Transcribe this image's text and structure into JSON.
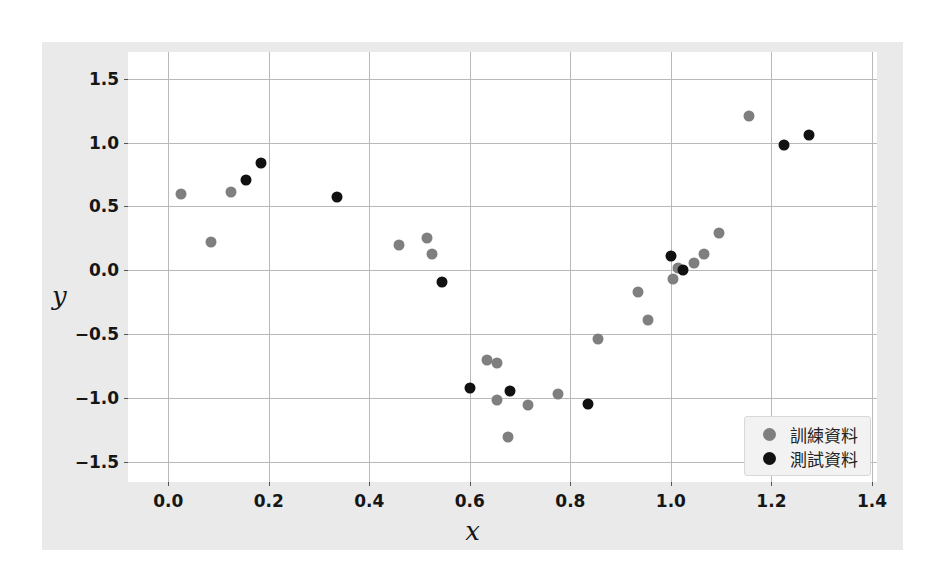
{
  "figure": {
    "background_color": "#eaeaea",
    "plot_background_color": "#ffffff",
    "grid_color": "#b9b9b9"
  },
  "chart_data": {
    "type": "scatter",
    "title": "",
    "xlabel": "x",
    "ylabel": "y",
    "xlim": [
      -0.08,
      1.41
    ],
    "ylim": [
      -1.66,
      1.71
    ],
    "xticks": [
      0.0,
      0.2,
      0.4,
      0.6,
      0.8,
      1.0,
      1.2,
      1.4
    ],
    "xticklabels": [
      "0.0",
      "0.2",
      "0.4",
      "0.6",
      "0.8",
      "1.0",
      "1.2",
      "1.4"
    ],
    "yticks": [
      1.5,
      1.0,
      0.5,
      0.0,
      -0.5,
      -1.0,
      -1.5
    ],
    "yticklabels": [
      "1.5",
      "1.0",
      "0.5",
      "0.0",
      "−0.5",
      "−1.0",
      "−1.5"
    ],
    "grid": true,
    "legend_position": "lower right",
    "series": [
      {
        "name": "訓練資料",
        "color": "#7f7f7f",
        "marker": "o",
        "marker_size": 11,
        "points": [
          [
            0.025,
            0.6
          ],
          [
            0.085,
            0.22
          ],
          [
            0.125,
            0.61
          ],
          [
            0.46,
            0.2
          ],
          [
            0.515,
            0.25
          ],
          [
            0.525,
            0.13
          ],
          [
            0.635,
            -0.7
          ],
          [
            0.655,
            -0.73
          ],
          [
            0.655,
            -1.02
          ],
          [
            0.675,
            -1.31
          ],
          [
            0.715,
            -1.06
          ],
          [
            0.775,
            -0.97
          ],
          [
            0.855,
            -0.54
          ],
          [
            0.935,
            -0.17
          ],
          [
            0.955,
            -0.39
          ],
          [
            1.005,
            -0.07
          ],
          [
            1.015,
            0.02
          ],
          [
            1.045,
            0.06
          ],
          [
            1.065,
            0.13
          ],
          [
            1.095,
            0.29
          ],
          [
            1.155,
            1.21
          ]
        ]
      },
      {
        "name": "測試資料",
        "color": "#111111",
        "marker": "o",
        "marker_size": 11,
        "points": [
          [
            0.155,
            0.71
          ],
          [
            0.185,
            0.84
          ],
          [
            0.335,
            0.57
          ],
          [
            0.545,
            -0.09
          ],
          [
            0.6,
            -0.92
          ],
          [
            0.68,
            -0.95
          ],
          [
            0.835,
            -1.05
          ],
          [
            1.0,
            0.11
          ],
          [
            1.025,
            0.0
          ],
          [
            1.225,
            0.98
          ],
          [
            1.275,
            1.06
          ]
        ]
      }
    ]
  },
  "legend": {
    "entries": [
      {
        "label": "訓練資料",
        "color": "#7f7f7f"
      },
      {
        "label": "測試資料",
        "color": "#111111"
      }
    ]
  }
}
